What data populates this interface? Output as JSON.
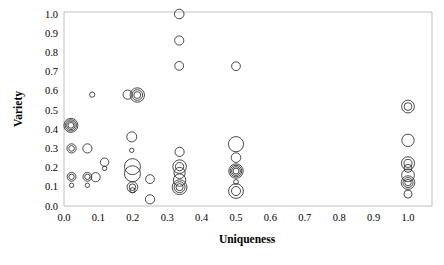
{
  "chart_data": {
    "type": "scatter",
    "title": "",
    "xlabel": "Uniqueness",
    "ylabel": "Variety",
    "xlim": [
      0.0,
      1.0
    ],
    "ylim": [
      0.0,
      1.0
    ],
    "grid": false,
    "legend": null,
    "marker_style": "open-circle-concentric-rings",
    "xticks": [
      "0.0",
      "0.1",
      "0.2",
      "0.3",
      "0.4",
      "0.5",
      "0.6",
      "0.7",
      "0.8",
      "0.9",
      "1.0"
    ],
    "yticks": [
      "0.0",
      "0.1",
      "0.2",
      "0.3",
      "0.4",
      "0.5",
      "0.6",
      "0.7",
      "0.8",
      "0.9",
      "1.0"
    ],
    "xtick_values": [
      0.0,
      0.1,
      0.2,
      0.3,
      0.4,
      0.5,
      0.6,
      0.7,
      0.8,
      0.9,
      1.0
    ],
    "ytick_values": [
      0.0,
      0.1,
      0.2,
      0.3,
      0.4,
      0.5,
      0.6,
      0.7,
      0.8,
      0.9,
      1.0
    ],
    "points": [
      {
        "x": 0.02,
        "y": 0.42,
        "r": 7.0,
        "rings": 4
      },
      {
        "x": 0.022,
        "y": 0.3,
        "r": 4.6,
        "rings": 2
      },
      {
        "x": 0.068,
        "y": 0.3,
        "r": 4.6,
        "rings": 1
      },
      {
        "x": 0.022,
        "y": 0.152,
        "r": 4.4,
        "rings": 2
      },
      {
        "x": 0.022,
        "y": 0.108,
        "r": 2.2,
        "rings": 1
      },
      {
        "x": 0.068,
        "y": 0.152,
        "r": 4.4,
        "rings": 2
      },
      {
        "x": 0.068,
        "y": 0.108,
        "r": 2.2,
        "rings": 1
      },
      {
        "x": 0.092,
        "y": 0.15,
        "r": 4.6,
        "rings": 1
      },
      {
        "x": 0.082,
        "y": 0.58,
        "r": 2.6,
        "rings": 1
      },
      {
        "x": 0.118,
        "y": 0.228,
        "r": 4.2,
        "rings": 1
      },
      {
        "x": 0.118,
        "y": 0.196,
        "r": 2.2,
        "rings": 1
      },
      {
        "x": 0.185,
        "y": 0.58,
        "r": 4.6,
        "rings": 1
      },
      {
        "x": 0.213,
        "y": 0.578,
        "r": 7.2,
        "rings": 3
      },
      {
        "x": 0.197,
        "y": 0.36,
        "r": 5.0,
        "rings": 1
      },
      {
        "x": 0.197,
        "y": 0.29,
        "r": 2.2,
        "rings": 1
      },
      {
        "x": 0.199,
        "y": 0.205,
        "r": 8.0,
        "rings": 1
      },
      {
        "x": 0.199,
        "y": 0.168,
        "r": 8.0,
        "rings": 1
      },
      {
        "x": 0.199,
        "y": 0.098,
        "r": 5.4,
        "rings": 2
      },
      {
        "x": 0.199,
        "y": 0.082,
        "r": 2.6,
        "rings": 1
      },
      {
        "x": 0.25,
        "y": 0.14,
        "r": 4.4,
        "rings": 1
      },
      {
        "x": 0.25,
        "y": 0.035,
        "r": 4.6,
        "rings": 1
      },
      {
        "x": 0.335,
        "y": 1.0,
        "r": 4.8,
        "rings": 1
      },
      {
        "x": 0.335,
        "y": 0.862,
        "r": 4.6,
        "rings": 1
      },
      {
        "x": 0.335,
        "y": 0.73,
        "r": 4.4,
        "rings": 1
      },
      {
        "x": 0.336,
        "y": 0.282,
        "r": 4.6,
        "rings": 1
      },
      {
        "x": 0.336,
        "y": 0.205,
        "r": 6.8,
        "rings": 2
      },
      {
        "x": 0.336,
        "y": 0.172,
        "r": 5.6,
        "rings": 1
      },
      {
        "x": 0.336,
        "y": 0.135,
        "r": 6.2,
        "rings": 1
      },
      {
        "x": 0.336,
        "y": 0.098,
        "r": 7.4,
        "rings": 3
      },
      {
        "x": 0.5,
        "y": 0.728,
        "r": 4.4,
        "rings": 1
      },
      {
        "x": 0.5,
        "y": 0.322,
        "r": 7.6,
        "rings": 1
      },
      {
        "x": 0.5,
        "y": 0.252,
        "r": 4.8,
        "rings": 1
      },
      {
        "x": 0.5,
        "y": 0.182,
        "r": 7.2,
        "rings": 4
      },
      {
        "x": 0.5,
        "y": 0.125,
        "r": 2.4,
        "rings": 1
      },
      {
        "x": 0.5,
        "y": 0.078,
        "r": 7.4,
        "rings": 2
      },
      {
        "x": 1.0,
        "y": 0.518,
        "r": 6.4,
        "rings": 2
      },
      {
        "x": 1.0,
        "y": 0.342,
        "r": 6.2,
        "rings": 1
      },
      {
        "x": 1.0,
        "y": 0.222,
        "r": 6.6,
        "rings": 2
      },
      {
        "x": 1.0,
        "y": 0.196,
        "r": 4.0,
        "rings": 1
      },
      {
        "x": 1.0,
        "y": 0.16,
        "r": 6.4,
        "rings": 1
      },
      {
        "x": 1.0,
        "y": 0.122,
        "r": 6.8,
        "rings": 3
      },
      {
        "x": 1.0,
        "y": 0.062,
        "r": 4.0,
        "rings": 1
      }
    ]
  }
}
